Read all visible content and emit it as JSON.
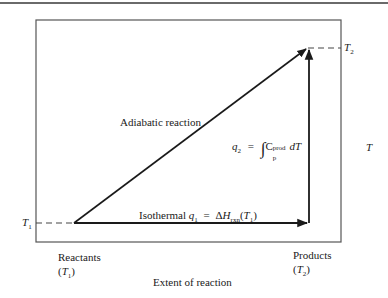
{
  "diagram": {
    "top_rule": true,
    "box": {
      "x": 36,
      "y": 20,
      "width": 305,
      "height": 222
    },
    "axes": {
      "x_label": "Extent of reaction",
      "y_label": "T",
      "y_ticks": [
        {
          "symbol": "T",
          "sub": "1",
          "y": 223
        },
        {
          "symbol": "T",
          "sub": "2",
          "y": 48
        }
      ]
    },
    "points": {
      "reactants": {
        "x": 74,
        "y": 223,
        "label": "Reactants",
        "temp_symbol": "T",
        "temp_sub": "1"
      },
      "products": {
        "x": 308,
        "y": 48,
        "label": "Products",
        "temp_symbol": "T",
        "temp_sub": "2"
      },
      "corner": {
        "x": 308,
        "y": 223
      }
    },
    "paths": {
      "adiabatic": {
        "label": "Adiabatic reaction"
      },
      "isothermal": {
        "label_prefix": "Isothermal",
        "q_symbol": "q",
        "q_sub": "1",
        "equals": "=",
        "delta": "Δ",
        "h_symbol": "H",
        "h_sub": "rxn",
        "arg_open": "(",
        "arg_symbol": "T",
        "arg_sub": "1",
        "arg_close": ")"
      },
      "heating": {
        "q_symbol": "q",
        "q_sub": "2",
        "equals": "=",
        "integral": "∫",
        "cp_symbol": "C",
        "cp_sub": "p",
        "cp_sup": "prod",
        "dT": "dT"
      }
    },
    "colors": {
      "line": "#1a1a1a",
      "frame": "#555555",
      "dash": "#444444"
    }
  }
}
